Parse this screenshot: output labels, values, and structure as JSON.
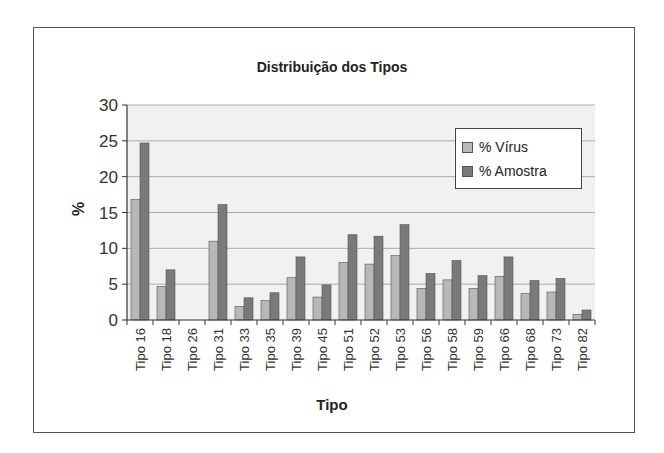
{
  "chart_data": {
    "type": "bar",
    "title": "Distribuição dos Tipos",
    "xlabel": "Tipo",
    "ylabel": "%",
    "ylim": [
      0,
      30
    ],
    "yticks": [
      0,
      5,
      10,
      15,
      20,
      25,
      30
    ],
    "grid": true,
    "legend_position": "upper right (inside plot)",
    "categories": [
      "Tipo 16",
      "Tipo 18",
      "Tipo 26",
      "Tipo 31",
      "Tipo 33",
      "Tipo 35",
      "Tipo 39",
      "Tipo 45",
      "Tipo 51",
      "Tipo 52",
      "Tipo 53",
      "Tipo 56",
      "Tipo 58",
      "Tipo 59",
      "Tipo 66",
      "Tipo 68",
      "Tipo 73",
      "Tipo 82"
    ],
    "series": [
      {
        "name": "% Vírus",
        "color": "#b8b8b8",
        "values": [
          16.8,
          4.7,
          0,
          11.0,
          1.9,
          2.7,
          5.9,
          3.2,
          8.0,
          7.8,
          9.0,
          4.4,
          5.6,
          4.4,
          6.1,
          3.7,
          3.9,
          0.8
        ]
      },
      {
        "name": "% Amostra",
        "color": "#7a7a7a",
        "values": [
          24.7,
          7.0,
          0,
          16.1,
          3.1,
          3.8,
          8.8,
          4.9,
          11.9,
          11.7,
          13.3,
          6.5,
          8.3,
          6.2,
          8.8,
          5.5,
          5.8,
          1.4
        ]
      }
    ]
  },
  "legend": {
    "items": [
      {
        "label": "% Vírus"
      },
      {
        "label": "% Amostra"
      }
    ]
  }
}
